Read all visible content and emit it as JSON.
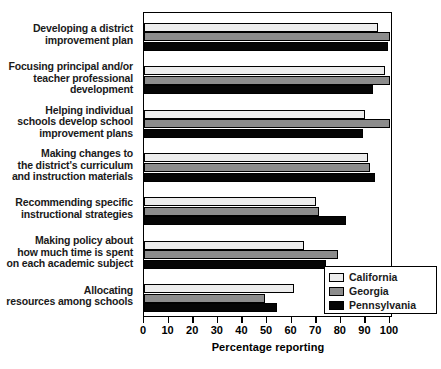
{
  "chart_data": {
    "type": "bar",
    "orientation": "horizontal",
    "title": "",
    "xlabel": "Percentage reporting",
    "ylabel": "",
    "xlim": [
      0,
      100
    ],
    "xticks": [
      0,
      10,
      20,
      30,
      40,
      50,
      60,
      70,
      80,
      90,
      100
    ],
    "grid": false,
    "legend_position": "bottom-right",
    "categories": [
      "Developing a district improvement plan",
      "Focusing principal and/or teacher professional development",
      "Helping individual schools develop school improvement plans",
      "Making changes to the district's curriculum and instruction materials",
      "Recommending specific instructional strategies",
      "Making policy about how much time is spent on each academic subject",
      "Allocating resources among schools"
    ],
    "category_lines": [
      [
        "Developing a district",
        "improvement plan"
      ],
      [
        "Focusing principal and/or",
        "teacher professional",
        "development"
      ],
      [
        "Helping individual",
        "schools develop school",
        "improvement plans"
      ],
      [
        "Making changes to",
        "the district's curriculum",
        "and instruction materials"
      ],
      [
        "Recommending specific",
        "instructional strategies"
      ],
      [
        "Making policy about",
        "how much time is spent",
        "on each academic subject"
      ],
      [
        "Allocating",
        "resources among schools"
      ]
    ],
    "series": [
      {
        "name": "California",
        "color": "#ececec",
        "values": [
          95,
          98,
          90,
          91,
          70,
          65,
          61
        ]
      },
      {
        "name": "Georgia",
        "color": "#8c8c8c",
        "values": [
          100,
          100,
          100,
          92,
          71,
          79,
          49
        ]
      },
      {
        "name": "Pennsylvania",
        "color": "#050505",
        "values": [
          99,
          93,
          89,
          94,
          82,
          74,
          54
        ]
      }
    ]
  },
  "axis": {
    "x_tick_labels": [
      "0",
      "10",
      "20",
      "30",
      "40",
      "50",
      "60",
      "70",
      "80",
      "90",
      "100"
    ],
    "x_title": "Percentage reporting"
  },
  "legend": {
    "entries": [
      {
        "label": "California"
      },
      {
        "label": "Georgia"
      },
      {
        "label": "Pennsylvania"
      }
    ]
  }
}
